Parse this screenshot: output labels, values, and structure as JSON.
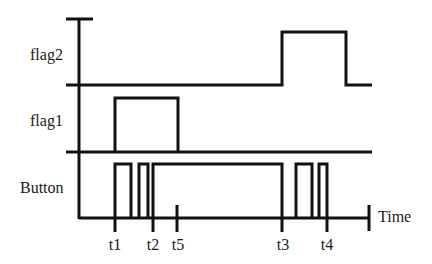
{
  "diagram": {
    "type": "timing-diagram",
    "colors": {
      "line": "#111111",
      "text": "#1a1a1a",
      "background": "#ffffff"
    },
    "signals": [
      {
        "name": "flag2",
        "label": "flag2",
        "high_intervals": [
          [
            "t3",
            "end of t4 burst"
          ]
        ]
      },
      {
        "name": "flag1",
        "label": "flag1",
        "high_intervals": [
          [
            "t1",
            "t5"
          ]
        ]
      },
      {
        "name": "button",
        "label": "Button",
        "pulses": 5,
        "description": "short press at t1, short press, long press from t2 to t3, two short presses ending at t4"
      }
    ],
    "axis": {
      "label": "Time"
    },
    "time_markers": [
      "t1",
      "t2",
      "t5",
      "t3",
      "t4"
    ]
  },
  "labels": {
    "flag2": "flag2",
    "flag1": "flag1",
    "button": "Button",
    "time": "Time",
    "t1": "t1",
    "t2": "t2",
    "t5": "t5",
    "t3": "t3",
    "t4": "t4"
  }
}
